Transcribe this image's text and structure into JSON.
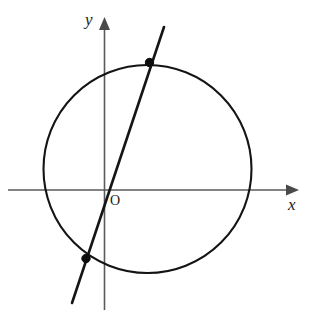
{
  "figure": {
    "width": 313,
    "height": 319,
    "background_color": "#ffffff"
  },
  "axes": {
    "x_axis": {
      "label": "x",
      "icon": "arrow-right-icon",
      "color": "#5a5a5a",
      "y_position": 190,
      "start_x": 8,
      "end_x": 298
    },
    "y_axis": {
      "label": "y",
      "icon": "arrow-up-icon",
      "color": "#5a5a5a",
      "x_position": 104.5,
      "start_y": 310,
      "end_y": 18
    },
    "origin": {
      "label": "O",
      "x": 104.5,
      "y": 190
    }
  },
  "chart_data": {
    "type": "scatter",
    "title": "",
    "xlabel": "x",
    "ylabel": "y",
    "grid": false,
    "legend": false,
    "origin_label": "O",
    "shapes": [
      {
        "name": "circle",
        "type": "circle",
        "center_px": [
          147.5,
          169.0
        ],
        "radius_px": 104.0,
        "stroke": "#141414",
        "stroke_width": 2.1,
        "fill": "none"
      },
      {
        "name": "secant-line",
        "type": "line",
        "from_px": [
          164.0,
          27.0
        ],
        "to_px": [
          72.0,
          303.0
        ],
        "slope_screen": -3.0,
        "stroke": "#141414",
        "stroke_width": 2.6
      }
    ],
    "points": [
      {
        "name": "upper-intersection-point",
        "x_px": 149.5,
        "y_px": 62.5,
        "radius_px": 4.2,
        "color": "#0d0d0d"
      },
      {
        "name": "lower-intersection-point",
        "x_px": 86.0,
        "y_px": 258.5,
        "radius_px": 4.2,
        "color": "#0d0d0d"
      }
    ]
  }
}
